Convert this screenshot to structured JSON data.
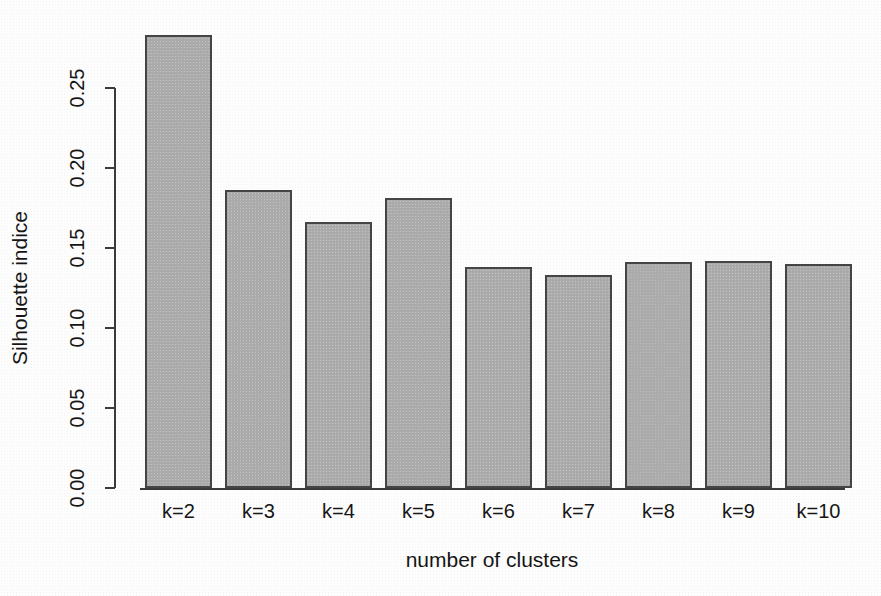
{
  "chart_data": {
    "type": "bar",
    "title": "",
    "subtitle": "",
    "xlabel": "number of clusters",
    "ylabel": "Silhouette indice",
    "categories": [
      "k=2",
      "k=3",
      "k=4",
      "k=5",
      "k=6",
      "k=7",
      "k=8",
      "k=9",
      "k=10"
    ],
    "values": [
      0.283,
      0.186,
      0.166,
      0.181,
      0.138,
      0.133,
      0.141,
      0.142,
      0.14
    ],
    "ylim": [
      0.0,
      0.29
    ],
    "yticks": [
      0.0,
      0.05,
      0.1,
      0.15,
      0.2,
      0.25
    ],
    "ytick_labels": [
      "0.00",
      "0.05",
      "0.10",
      "0.15",
      "0.20",
      "0.25"
    ],
    "grid": false,
    "legend": null,
    "legend_position": "none",
    "bar_fill_color": "#ababab",
    "bar_border_color": "#454545",
    "axis_color": "#3b3b3b",
    "text_color": "#151515",
    "background_color": "#fdfdfd"
  }
}
